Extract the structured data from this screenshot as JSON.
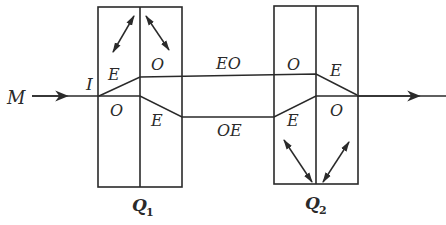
{
  "diagram": {
    "input_label": "M",
    "incidence_point_label": "I",
    "crystals": [
      {
        "name": "Q",
        "subscript": "1",
        "left_half_label_top": "E",
        "right_half_label_top": "O",
        "left_half_label_bottom": "O",
        "right_half_label_bottom": "E"
      },
      {
        "name": "Q",
        "subscript": "2",
        "left_half_label_top": "O",
        "right_half_label_top": "E",
        "left_half_label_bottom": "E",
        "right_half_label_bottom": "O"
      }
    ],
    "upper_path_label": "EO",
    "lower_path_label": "OE",
    "line_color": "#2a2a2a",
    "background_color": "#ffffff"
  }
}
